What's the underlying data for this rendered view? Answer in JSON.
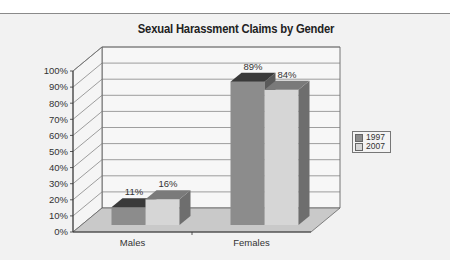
{
  "chart_data": {
    "type": "bar",
    "subtype": "3d-clustered-column",
    "title": "Sexual Harassment Claims by Gender",
    "categories": [
      "Males",
      "Females"
    ],
    "series": [
      {
        "name": "1997",
        "values": [
          11,
          89
        ],
        "color": "#8c8c8c",
        "top_color": "#3a3a3a",
        "side_color": "#5a5a5a"
      },
      {
        "name": "2007",
        "values": [
          16,
          84
        ],
        "color": "#d6d6d6",
        "top_color": "#7a7a7a",
        "side_color": "#6e6e6e"
      }
    ],
    "data_labels": [
      [
        "11%",
        "89%"
      ],
      [
        "16%",
        "84%"
      ]
    ],
    "xlabel": "",
    "ylabel": "",
    "ylim": [
      0,
      100
    ],
    "yticks": [
      "0%",
      "10%",
      "20%",
      "30%",
      "40%",
      "50%",
      "60%",
      "70%",
      "80%",
      "90%",
      "100%"
    ],
    "grid": true,
    "legend_position": "right"
  },
  "legend": {
    "items": [
      {
        "label": "1997"
      },
      {
        "label": "2007"
      }
    ]
  }
}
